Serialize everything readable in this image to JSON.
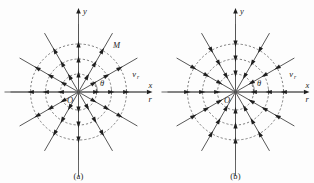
{
  "figure": {
    "kind": "polar-radial-velocity-field",
    "background_color": "#fdfdfd",
    "stroke_color": "#3a3a3a",
    "axis_color": "#555555",
    "dashed_circle_color": "#4a4a4a",
    "arrow_color": "#1f1f1f",
    "text_color": "#1d1d1d"
  },
  "geometry": {
    "center": {
      "x": 78.5,
      "y": 92.0
    },
    "ray_count": 12,
    "ray_angles_deg": [
      0,
      30,
      60,
      90,
      120,
      150,
      180,
      210,
      240,
      270,
      300,
      330
    ],
    "ray_length": 68,
    "circle_radii": [
      18,
      33,
      48
    ],
    "arrow_radii": [
      18,
      33,
      48
    ],
    "theta_arc_radius": 19,
    "theta_arc_start_deg": 0,
    "theta_arc_end_deg": 30,
    "axis_half_length_x": 74,
    "axis_half_length_y": 84,
    "tick_radii": [
      18,
      33,
      48
    ]
  },
  "panels": [
    {
      "id": "a",
      "caption": "(a)",
      "flow_direction": "outward",
      "labels": {
        "y_axis": "y",
        "x_axis": "x",
        "r_axis": "r",
        "origin": "O",
        "theta": "θ",
        "velocity": "v",
        "velocity_sub": "r",
        "point": "M"
      }
    },
    {
      "id": "b",
      "caption": "(b)",
      "flow_direction": "inward",
      "labels": {
        "y_axis": "y",
        "x_axis": "x",
        "r_axis": "r",
        "origin": "O",
        "theta": "θ",
        "velocity": "v",
        "velocity_sub": "r",
        "point": ""
      }
    }
  ]
}
